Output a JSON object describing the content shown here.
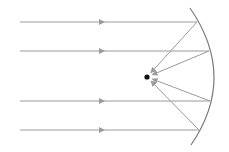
{
  "diagram": {
    "type": "concave-mirror-ray-diagram",
    "colors": {
      "ray": "#9a9a9a",
      "mirror": "#7a7a7a",
      "focus": "#111111"
    },
    "focus": {
      "x": 147,
      "y": 77
    },
    "mirror": {
      "top": [
        190,
        8
      ],
      "apex": [
        214,
        77
      ],
      "bottom": [
        191,
        145
      ]
    },
    "incident_rays": [
      {
        "y": 22,
        "x_start": 20,
        "x_end": 197,
        "arrow_x": 104
      },
      {
        "y": 51,
        "x_start": 20,
        "x_end": 209,
        "arrow_x": 104
      },
      {
        "y": 101,
        "x_start": 20,
        "x_end": 210,
        "arrow_x": 104
      },
      {
        "y": 130,
        "x_start": 20,
        "x_end": 199,
        "arrow_x": 104
      }
    ]
  }
}
